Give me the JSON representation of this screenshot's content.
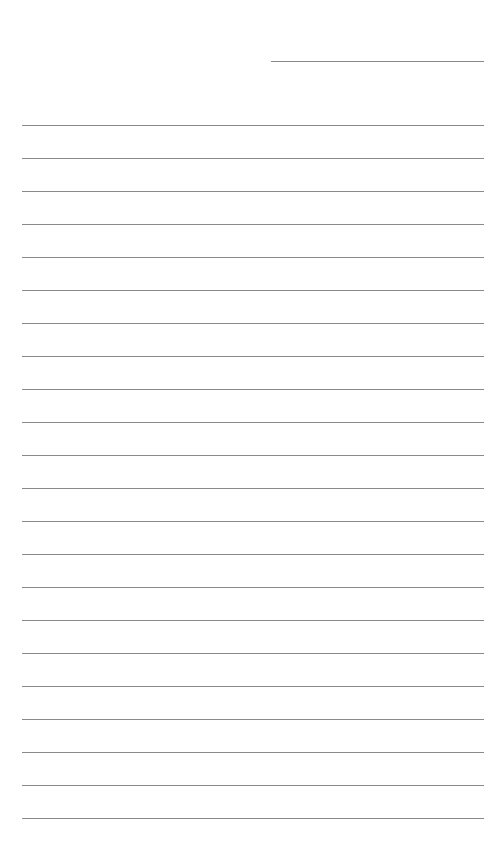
{
  "page": {
    "type": "lined-paper",
    "header_field": {
      "value": ""
    },
    "line_color": "#8a8a8a",
    "rules": [
      {
        "y": 125,
        "value": ""
      },
      {
        "y": 158,
        "value": ""
      },
      {
        "y": 191,
        "value": ""
      },
      {
        "y": 224,
        "value": ""
      },
      {
        "y": 257,
        "value": ""
      },
      {
        "y": 290,
        "value": ""
      },
      {
        "y": 323,
        "value": ""
      },
      {
        "y": 356,
        "value": ""
      },
      {
        "y": 389,
        "value": ""
      },
      {
        "y": 422,
        "value": ""
      },
      {
        "y": 455,
        "value": ""
      },
      {
        "y": 488,
        "value": ""
      },
      {
        "y": 521,
        "value": ""
      },
      {
        "y": 554,
        "value": ""
      },
      {
        "y": 587,
        "value": ""
      },
      {
        "y": 620,
        "value": ""
      },
      {
        "y": 653,
        "value": ""
      },
      {
        "y": 686,
        "value": ""
      },
      {
        "y": 719,
        "value": ""
      },
      {
        "y": 752,
        "value": ""
      },
      {
        "y": 785,
        "value": ""
      },
      {
        "y": 818,
        "value": ""
      }
    ]
  }
}
